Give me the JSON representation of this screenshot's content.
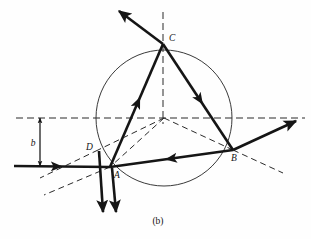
{
  "figure": {
    "caption": "(b)",
    "caption_letter": "b"
  },
  "style": {
    "ray_color": "#151515",
    "dashed_color": "#2a2a2a",
    "circle_color": "#3a3a3a",
    "background": "#fefefe",
    "ray_width": 2.6,
    "dash_width": 1.0,
    "circle_width": 1.0,
    "dash_pattern": "7,4"
  },
  "circle": {
    "name": "drop-boundary",
    "cx": 164,
    "cy": 118,
    "r": 68
  },
  "points": [
    {
      "id": "A",
      "label": "A",
      "x": 110,
      "y": 167,
      "label_x": 114,
      "label_y": 178
    },
    {
      "id": "B",
      "label": "B",
      "x": 233,
      "y": 150,
      "label_x": 231,
      "label_y": 161
    },
    {
      "id": "C",
      "label": "C",
      "x": 163,
      "y": 44,
      "label_x": 169,
      "label_y": 41
    },
    {
      "id": "D",
      "label": "D",
      "x": 98,
      "y": 150,
      "label_x": 86,
      "label_y": 150
    }
  ],
  "axes": {
    "horizontal_dashed": {
      "name": "optic-axis",
      "x1": 16,
      "y1": 118,
      "x2": 305,
      "y2": 118
    },
    "vertical_dashed": {
      "name": "vertical-axis",
      "x1": 163,
      "y1": 12,
      "x2": 163,
      "y2": 124
    }
  },
  "impact_parameter": {
    "label": "b",
    "label_x": 33,
    "label_y": 146,
    "arrow_x": 40,
    "y_top": 118,
    "y_bottom": 166
  },
  "rays": [
    {
      "name": "incident-ray",
      "points": "14,166 110,167",
      "arrow_at": 0.44
    },
    {
      "name": "ray-A-to-C",
      "points": "110,167 163,44",
      "arrow_at": 0.52
    },
    {
      "name": "ray-C-to-B",
      "points": "163,44 233,150",
      "arrow_at": 0.52
    },
    {
      "name": "ray-B-to-D",
      "points": "233,150 110,167",
      "arrow_at": 0.5
    },
    {
      "name": "exit-ray-B",
      "points": "233,150 296,121",
      "arrow_at": 1.0
    },
    {
      "name": "exit-ray-C",
      "points": "163,44 119,11",
      "arrow_at": 1.0
    },
    {
      "name": "exit-ray-D1",
      "points": "99,151 103,212",
      "arrow_at": 1.0
    },
    {
      "name": "exit-ray-A1",
      "points": "112,168 116,212",
      "arrow_at": 1.0
    }
  ],
  "dashed_construction": [
    {
      "name": "radius-center-to-D",
      "x1": 164,
      "y1": 118,
      "x2": 98,
      "y2": 150
    },
    {
      "name": "radius-center-to-A",
      "x1": 164,
      "y1": 118,
      "x2": 110,
      "y2": 167
    },
    {
      "name": "radius-center-to-B",
      "x1": 164,
      "y1": 118,
      "x2": 233,
      "y2": 150
    },
    {
      "name": "normal-extension-D",
      "x1": 98,
      "y1": 150,
      "x2": 40,
      "y2": 178
    },
    {
      "name": "normal-extension-A",
      "x1": 110,
      "y1": 167,
      "x2": 44,
      "y2": 195
    },
    {
      "name": "normal-extension-B",
      "x1": 233,
      "y1": 150,
      "x2": 283,
      "y2": 173
    }
  ]
}
